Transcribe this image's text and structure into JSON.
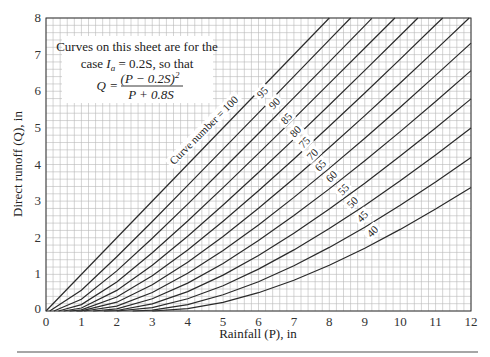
{
  "chart_data": {
    "type": "line",
    "title": "",
    "xlabel": "Rainfall (P), in",
    "ylabel": "Direct runoff (Q), in",
    "xlim": [
      0,
      12
    ],
    "ylim": [
      0,
      8
    ],
    "x_ticks": [
      "0",
      "1",
      "2",
      "3",
      "4",
      "5",
      "6",
      "7",
      "8",
      "9",
      "10",
      "11",
      "12"
    ],
    "y_ticks": [
      "0",
      "1",
      "2",
      "3",
      "4",
      "5",
      "6",
      "7",
      "8"
    ],
    "grid": true,
    "grid_minor_step": 0.2,
    "annotation": {
      "line1": "Curves on this sheet are for the",
      "line2_prefix": "case ",
      "line2_var": "I",
      "line2_sub": "a",
      "line2_suffix": " = 0.2S, so that",
      "formula_lhs": "Q =",
      "formula_num": "(P − 0.2S)",
      "formula_num_exp": "2",
      "formula_den": "P + 0.8S"
    },
    "curve_label_prefix": "Curve number = ",
    "series": [
      {
        "name": "100",
        "label": "100",
        "label_pos": [
          222,
          113
        ],
        "points": [
          [
            0,
            0
          ],
          [
            8,
            8
          ]
        ]
      },
      {
        "name": "95",
        "label": "95",
        "label_pos": [
          263,
          93
        ],
        "points": [
          [
            0.105,
            0
          ],
          [
            1,
            0.564
          ],
          [
            2,
            1.483
          ],
          [
            3,
            2.444
          ],
          [
            4,
            3.431
          ],
          [
            5,
            4.42
          ],
          [
            6,
            5.412
          ],
          [
            7,
            6.406
          ],
          [
            8,
            7.402
          ],
          [
            8.6,
            8.0
          ]
        ]
      },
      {
        "name": "90",
        "label": "90",
        "label_pos": [
          275,
          104
        ],
        "points": [
          [
            0.222,
            0
          ],
          [
            1,
            0.32
          ],
          [
            2,
            1.094
          ],
          [
            3,
            1.984
          ],
          [
            4,
            2.919
          ],
          [
            5,
            3.877
          ],
          [
            6,
            4.846
          ],
          [
            7,
            5.823
          ],
          [
            8,
            6.805
          ],
          [
            9,
            7.791
          ],
          [
            9.2,
            7.99
          ]
        ]
      },
      {
        "name": "85",
        "label": "85",
        "label_pos": [
          287,
          119
        ],
        "points": [
          [
            0.353,
            0
          ],
          [
            1,
            0.174
          ],
          [
            2,
            0.795
          ],
          [
            3,
            1.588
          ],
          [
            4,
            2.458
          ],
          [
            5,
            3.368
          ],
          [
            6,
            4.302
          ],
          [
            7,
            5.252
          ],
          [
            8,
            6.213
          ],
          [
            9,
            7.181
          ],
          [
            9.85,
            8.0
          ]
        ]
      },
      {
        "name": "80",
        "label": "80",
        "label_pos": [
          296,
          132
        ],
        "points": [
          [
            0.5,
            0
          ],
          [
            1,
            0.083
          ],
          [
            2,
            0.563
          ],
          [
            3,
            1.25
          ],
          [
            4,
            2.042
          ],
          [
            5,
            2.893
          ],
          [
            6,
            3.781
          ],
          [
            7,
            4.694
          ],
          [
            8,
            5.625
          ],
          [
            9,
            6.568
          ],
          [
            10,
            7.521
          ],
          [
            10.5,
            8.0
          ]
        ]
      },
      {
        "name": "75",
        "label": "75",
        "label_pos": [
          305,
          143
        ],
        "points": [
          [
            0.667,
            0
          ],
          [
            1,
            0.03
          ],
          [
            2,
            0.381
          ],
          [
            3,
            0.961
          ],
          [
            4,
            1.667
          ],
          [
            5,
            2.449
          ],
          [
            6,
            3.282
          ],
          [
            7,
            4.149
          ],
          [
            8,
            5.042
          ],
          [
            9,
            5.952
          ],
          [
            10,
            6.877
          ],
          [
            11,
            7.813
          ],
          [
            11.2,
            8.0
          ]
        ]
      },
      {
        "name": "70",
        "label": "70",
        "label_pos": [
          313,
          155
        ],
        "points": [
          [
            0.857,
            0
          ],
          [
            1,
            0.005
          ],
          [
            2,
            0.241
          ],
          [
            3,
            0.714
          ],
          [
            4,
            1.33
          ],
          [
            5,
            2.036
          ],
          [
            6,
            2.805
          ],
          [
            7,
            3.618
          ],
          [
            8,
            4.464
          ],
          [
            9,
            5.335
          ],
          [
            10,
            6.225
          ],
          [
            11,
            7.13
          ],
          [
            11.95,
            8.0
          ]
        ]
      },
      {
        "name": "65",
        "label": "65",
        "label_pos": [
          321,
          166
        ],
        "points": [
          [
            1.077,
            0
          ],
          [
            2,
            0.135
          ],
          [
            3,
            0.506
          ],
          [
            4,
            1.028
          ],
          [
            5,
            1.653
          ],
          [
            6,
            2.351
          ],
          [
            7,
            3.102
          ],
          [
            8,
            3.894
          ],
          [
            9,
            4.717
          ],
          [
            10,
            5.565
          ],
          [
            11,
            6.432
          ],
          [
            12,
            7.316
          ]
        ]
      },
      {
        "name": "60",
        "label": "60",
        "label_pos": [
          332,
          177
        ],
        "points": [
          [
            1.333,
            0
          ],
          [
            2,
            0.061
          ],
          [
            3,
            0.333
          ],
          [
            4,
            0.762
          ],
          [
            5,
            1.301
          ],
          [
            6,
            1.922
          ],
          [
            7,
            2.604
          ],
          [
            8,
            3.333
          ],
          [
            9,
            4.101
          ],
          [
            10,
            4.899
          ],
          [
            11,
            5.721
          ],
          [
            12,
            6.564
          ]
        ]
      },
      {
        "name": "55",
        "label": "55",
        "label_pos": [
          344,
          190
        ],
        "points": [
          [
            1.636,
            0
          ],
          [
            2,
            0.015
          ],
          [
            3,
            0.195
          ],
          [
            4,
            0.53
          ],
          [
            5,
            0.98
          ],
          [
            6,
            1.518
          ],
          [
            7,
            2.124
          ],
          [
            8,
            2.784
          ],
          [
            9,
            3.488
          ],
          [
            10,
            4.228
          ],
          [
            11,
            4.997
          ],
          [
            12,
            5.791
          ]
        ]
      },
      {
        "name": "50",
        "label": "50",
        "label_pos": [
          353,
          203
        ],
        "points": [
          [
            2,
            0
          ],
          [
            3,
            0.091
          ],
          [
            4,
            0.333
          ],
          [
            5,
            0.692
          ],
          [
            6,
            1.143
          ],
          [
            7,
            1.667
          ],
          [
            8,
            2.25
          ],
          [
            9,
            2.882
          ],
          [
            10,
            3.556
          ],
          [
            11,
            4.263
          ],
          [
            12,
            5.0
          ]
        ]
      },
      {
        "name": "45",
        "label": "45",
        "label_pos": [
          363,
          217
        ],
        "points": [
          [
            2.444,
            0
          ],
          [
            3,
            0.024
          ],
          [
            4,
            0.176
          ],
          [
            5,
            0.442
          ],
          [
            6,
            0.801
          ],
          [
            7,
            1.237
          ],
          [
            8,
            1.736
          ],
          [
            9,
            2.289
          ],
          [
            10,
            2.886
          ],
          [
            11,
            3.523
          ],
          [
            12,
            4.193
          ]
        ]
      },
      {
        "name": "40",
        "label": "40",
        "label_pos": [
          373,
          232
        ],
        "points": [
          [
            3,
            0
          ],
          [
            4,
            0.063
          ],
          [
            5,
            0.235
          ],
          [
            6,
            0.5
          ],
          [
            7,
            0.842
          ],
          [
            8,
            1.25
          ],
          [
            9,
            1.714
          ],
          [
            10,
            2.227
          ],
          [
            11,
            2.783
          ],
          [
            12,
            3.375
          ]
        ]
      }
    ]
  }
}
